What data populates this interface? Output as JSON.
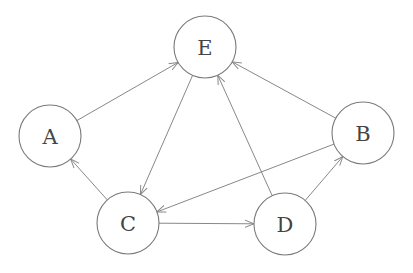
{
  "diagram": {
    "type": "directed-graph",
    "colors": {
      "node_stroke": "#7a7a7a",
      "edge": "#888888",
      "label": "#444444"
    },
    "nodes": [
      {
        "id": "E",
        "label": "E",
        "x": 205,
        "y": 47,
        "r": 31
      },
      {
        "id": "A",
        "label": "A",
        "x": 50,
        "y": 136,
        "r": 31
      },
      {
        "id": "B",
        "label": "B",
        "x": 363,
        "y": 133,
        "r": 31
      },
      {
        "id": "C",
        "label": "C",
        "x": 128,
        "y": 223,
        "r": 31
      },
      {
        "id": "D",
        "label": "D",
        "x": 285,
        "y": 224,
        "r": 31
      }
    ],
    "edges": [
      {
        "from": "A",
        "to": "E"
      },
      {
        "from": "E",
        "to": "C"
      },
      {
        "from": "C",
        "to": "A"
      },
      {
        "from": "B",
        "to": "C"
      },
      {
        "from": "B",
        "to": "E"
      },
      {
        "from": "D",
        "to": "E"
      },
      {
        "from": "D",
        "to": "B"
      },
      {
        "from": "C",
        "to": "D"
      }
    ]
  }
}
